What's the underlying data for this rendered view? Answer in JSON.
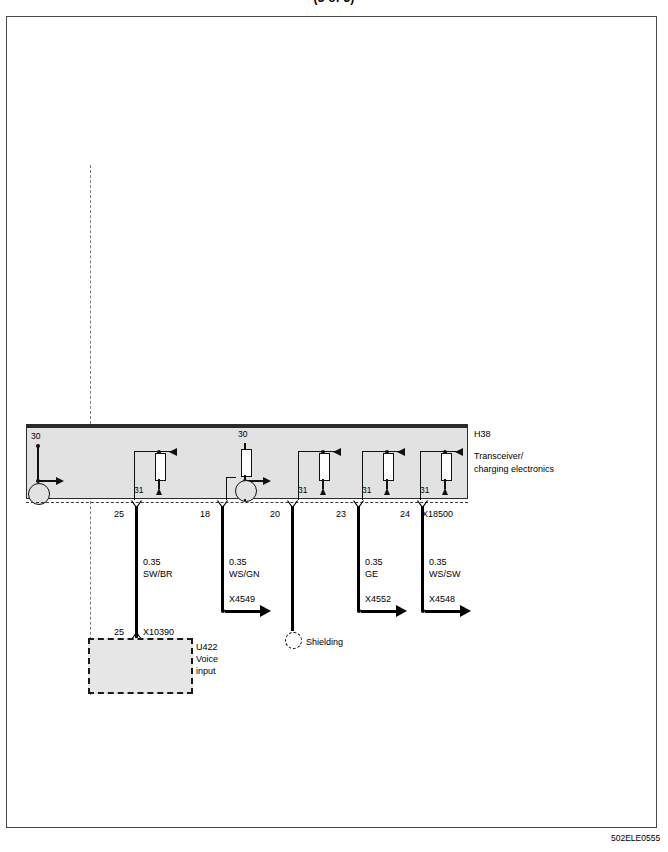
{
  "page": {
    "title": "(3 of 3)",
    "footer_code": "502ELE0555"
  },
  "module": {
    "id": "H38",
    "name_line1": "Transceiver/",
    "name_line2": "charging electronics",
    "connector": "X18500",
    "internal_labels": {
      "supply_left": "30",
      "supply_mid": "30",
      "ground": "31"
    }
  },
  "pins": [
    {
      "number": "25"
    },
    {
      "number": "18"
    },
    {
      "number": "20"
    },
    {
      "number": "23"
    },
    {
      "number": "24"
    }
  ],
  "wires": [
    {
      "size": "0.35",
      "color": "SW/BR"
    },
    {
      "size": "0.35",
      "color": "WS/GN"
    },
    {
      "size": "",
      "color": ""
    },
    {
      "size": "0.35",
      "color": "GE"
    },
    {
      "size": "0.35",
      "color": "WS/SW"
    }
  ],
  "connectors": [
    {
      "name": "X4549"
    },
    {
      "name": "X4552"
    },
    {
      "name": "X4548"
    }
  ],
  "shielding": {
    "label": "Shielding"
  },
  "device": {
    "connector_pin": "25",
    "connector_name": "X10390",
    "id": "U422",
    "name_line1": "Voice",
    "name_line2": "input"
  }
}
